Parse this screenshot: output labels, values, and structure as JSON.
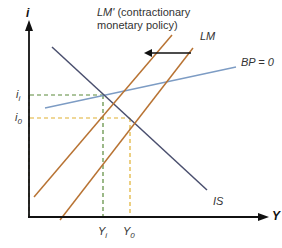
{
  "diagram": {
    "type": "IS-LM-BP",
    "title": "",
    "axes": {
      "y_label": "i",
      "x_label": "Y"
    },
    "curves": {
      "is": {
        "label": "IS",
        "color": "#4a4f6e"
      },
      "lm": {
        "label": "LM",
        "color": "#b87333"
      },
      "lm_prime": {
        "label_italic": "LM'",
        "label_rest_line1": " (contractionary",
        "label_line2": "monetary policy)",
        "color": "#b87333"
      },
      "bp": {
        "label": "BP = 0",
        "color": "#7d9cc4"
      }
    },
    "shift_arrow": {
      "direction": "left",
      "color": "#111111"
    },
    "levels": {
      "i1": {
        "label_main": "i",
        "label_sub": "i",
        "color": "#5a8a3a"
      },
      "i0": {
        "label_main": "i",
        "label_sub": "0",
        "color": "#e0b030"
      },
      "y1": {
        "label_main": "Y",
        "label_sub": "i",
        "color": "#5a8a3a"
      },
      "y0": {
        "label_main": "Y",
        "label_sub": "0",
        "color": "#e0b030"
      }
    }
  }
}
